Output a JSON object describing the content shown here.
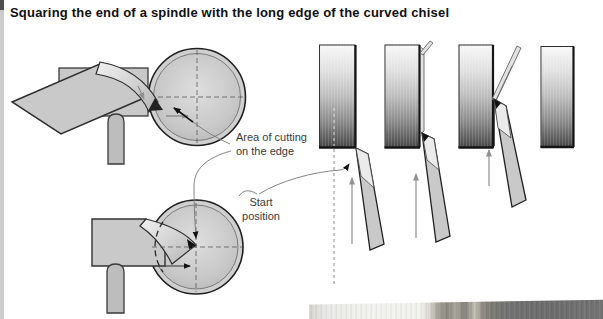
{
  "figure": {
    "title": "Squaring the end of a spindle with the long edge of the curved chisel"
  },
  "annotations": {
    "area_of_cutting": {
      "line1": "Area of cutting",
      "line2": "on the edge"
    },
    "start_position": {
      "line1": "Start",
      "line2": "position"
    }
  },
  "colors": {
    "background": "#ffffff",
    "title_text": "#0f0f0f",
    "annotation_text": "#3a3a3a",
    "steel_fill": "#c9c9c9",
    "dark_ink": "#1f1f1f",
    "leader_gray": "#777777",
    "arrow_gray": "#999999"
  }
}
